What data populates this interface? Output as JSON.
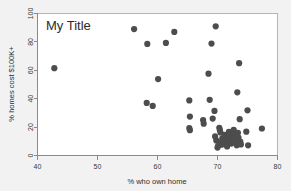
{
  "chart_data": {
    "type": "scatter",
    "title": "My Title",
    "xlabel": "% who own home",
    "ylabel": "% homes cost $100K+",
    "xlim": [
      40,
      80
    ],
    "ylim": [
      0,
      100
    ],
    "xticks": [
      40,
      50,
      60,
      70,
      80
    ],
    "yticks": [
      0,
      20,
      40,
      60,
      80,
      100
    ],
    "grid": false,
    "legend": null,
    "marker_color": "#4d4d4d",
    "marker_size": 3.1,
    "background_color": "#f2f2f2",
    "plot_background_color": "#ffffff",
    "points": [
      [
        42.8,
        61.5
      ],
      [
        56.1,
        89.0
      ],
      [
        58.3,
        78.6
      ],
      [
        58.2,
        37.0
      ],
      [
        59.2,
        34.9
      ],
      [
        60.1,
        53.8
      ],
      [
        61.4,
        79.3
      ],
      [
        62.8,
        87.0
      ],
      [
        65.3,
        38.8
      ],
      [
        65.4,
        27.4
      ],
      [
        65.3,
        19.3
      ],
      [
        65.4,
        17.8
      ],
      [
        67.6,
        25.0
      ],
      [
        67.7,
        22.4
      ],
      [
        68.5,
        57.6
      ],
      [
        68.7,
        39.2
      ],
      [
        69.0,
        78.8
      ],
      [
        69.2,
        26.0
      ],
      [
        69.5,
        31.4
      ],
      [
        69.7,
        91.0
      ],
      [
        69.6,
        13.4
      ],
      [
        69.8,
        10.6
      ],
      [
        70.0,
        5.6
      ],
      [
        70.1,
        6.8
      ],
      [
        70.3,
        19.5
      ],
      [
        70.4,
        17.8
      ],
      [
        70.5,
        16.2
      ],
      [
        70.4,
        9.0
      ],
      [
        70.6,
        7.6
      ],
      [
        70.8,
        12.0
      ],
      [
        70.9,
        10.4
      ],
      [
        71.0,
        8.0
      ],
      [
        71.2,
        14.6
      ],
      [
        71.3,
        11.0
      ],
      [
        71.5,
        9.4
      ],
      [
        71.6,
        6.4
      ],
      [
        71.8,
        12.8
      ],
      [
        71.9,
        16.6
      ],
      [
        72.0,
        13.6
      ],
      [
        72.1,
        10.0
      ],
      [
        72.3,
        8.4
      ],
      [
        72.4,
        15.0
      ],
      [
        72.6,
        12.2
      ],
      [
        72.7,
        18.0
      ],
      [
        72.8,
        9.6
      ],
      [
        73.0,
        14.0
      ],
      [
        73.1,
        11.2
      ],
      [
        73.2,
        7.2
      ],
      [
        73.4,
        16.0
      ],
      [
        73.5,
        12.6
      ],
      [
        73.3,
        44.5
      ],
      [
        73.6,
        65.0
      ],
      [
        73.8,
        9.8
      ],
      [
        73.9,
        7.8
      ],
      [
        73.7,
        25.6
      ],
      [
        74.8,
        16.8
      ],
      [
        75.1,
        7.2
      ],
      [
        75.0,
        31.8
      ],
      [
        77.4,
        19.0
      ]
    ]
  }
}
